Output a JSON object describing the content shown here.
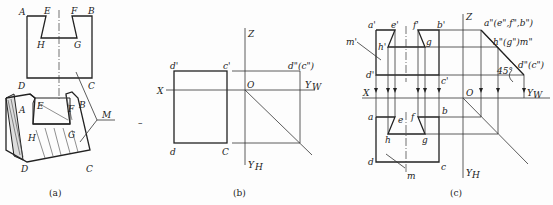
{
  "figures": {
    "a": {
      "caption": "(a)",
      "labels": {
        "A": "A",
        "E": "E",
        "F": "F",
        "B": "B",
        "H": "H",
        "G": "G",
        "D": "D",
        "C": "C",
        "M": "M",
        "A2": "A",
        "E2": "E",
        "F2": "F",
        "B2": "B",
        "H2": "H",
        "G2": "G",
        "D2": "D",
        "C2": "C"
      }
    },
    "b": {
      "caption": "(b)",
      "labels": {
        "Z": "Z",
        "X": "X",
        "O": "O",
        "YW": "Y",
        "YW_sub": "W",
        "YH": "Y",
        "YH_sub": "H",
        "dp": "d'",
        "cp": "c'",
        "dpp": "d\"(c\")",
        "d": "d",
        "C": "C"
      },
      "dash_mark": "–"
    },
    "c": {
      "caption": "(c)",
      "labels": {
        "ap": "a'",
        "ep": "e'",
        "fp": "f'",
        "bp": "b'",
        "mp": "m'",
        "hp": "h'",
        "g1": "g",
        "dp": "d'",
        "cp": "c'",
        "Z": "Z",
        "X": "X",
        "O": "O",
        "YW": "Y",
        "YW_sub": "W",
        "YH": "Y",
        "YH_sub": "H",
        "app": "a\"(e\",f\",b\")",
        "hpp": "h\"(g\")m\"",
        "dpp": "d\"(c\")",
        "angle": "45°",
        "a": "a",
        "e": "e",
        "f": "f",
        "b": "b",
        "h": "h",
        "g": "g",
        "d": "d",
        "c": "c",
        "m": "m"
      }
    }
  }
}
